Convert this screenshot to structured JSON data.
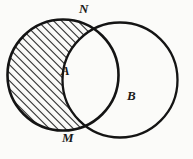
{
  "figure": {
    "type": "venn-diagram",
    "background_color": "#fbfbf9",
    "stroke_color": "#141414",
    "hatch_color": "#1a1a1a",
    "labels": {
      "circle_a": "A",
      "circle_b": "B",
      "intersection_top": "N",
      "intersection_bottom": "M"
    },
    "geometry": {
      "circle_a": {
        "cx": 63,
        "cy": 75,
        "r": 56
      },
      "circle_b": {
        "cx": 120,
        "cy": 80,
        "r": 58
      },
      "hatch_angle_deg": 45,
      "hatch_spacing_px": 4,
      "hatch_line_width_px": 1.5
    }
  }
}
